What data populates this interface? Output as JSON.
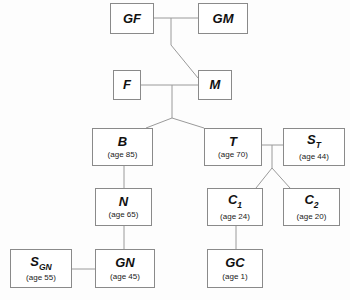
{
  "diagram": {
    "background_color": "#fdfdfd",
    "box_border_color": "#8a8a8a",
    "line_color": "#9a9a9a",
    "nodes": [
      {
        "id": "GF",
        "label": "GF",
        "subscript": "",
        "age": "",
        "x": 110,
        "y": 3,
        "w": 44,
        "h": 31
      },
      {
        "id": "GM",
        "label": "GM",
        "subscript": "",
        "age": "",
        "x": 198,
        "y": 3,
        "w": 50,
        "h": 31
      },
      {
        "id": "F",
        "label": "F",
        "subscript": "",
        "age": "",
        "x": 113,
        "y": 70,
        "w": 28,
        "h": 30
      },
      {
        "id": "M",
        "label": "M",
        "subscript": "",
        "age": "",
        "x": 198,
        "y": 70,
        "w": 34,
        "h": 30
      },
      {
        "id": "B",
        "label": "B",
        "subscript": "",
        "age": "(age 85)",
        "x": 92,
        "y": 128,
        "w": 61,
        "h": 38
      },
      {
        "id": "T",
        "label": "T",
        "subscript": "",
        "age": "(age 70)",
        "x": 204,
        "y": 128,
        "w": 58,
        "h": 38
      },
      {
        "id": "ST",
        "label": "S",
        "subscript": "T",
        "age": "(age 44)",
        "x": 283,
        "y": 128,
        "w": 62,
        "h": 38
      },
      {
        "id": "N",
        "label": "N",
        "subscript": "",
        "age": "(age 65)",
        "x": 95,
        "y": 188,
        "w": 57,
        "h": 38
      },
      {
        "id": "C1",
        "label": "C",
        "subscript": "1",
        "age": "(age 24)",
        "x": 207,
        "y": 188,
        "w": 56,
        "h": 38
      },
      {
        "id": "C2",
        "label": "C",
        "subscript": "2",
        "age": "(age 20)",
        "x": 283,
        "y": 188,
        "w": 57,
        "h": 38
      },
      {
        "id": "SGN",
        "label": "S",
        "subscript": "GN",
        "age": "(age 55)",
        "x": 10,
        "y": 249,
        "w": 62,
        "h": 39
      },
      {
        "id": "GN",
        "label": "GN",
        "subscript": "",
        "age": "(age 45)",
        "x": 95,
        "y": 249,
        "w": 60,
        "h": 39
      },
      {
        "id": "GC",
        "label": "GC",
        "subscript": "",
        "age": "(age 1)",
        "x": 207,
        "y": 249,
        "w": 56,
        "h": 39
      }
    ],
    "edges": [
      {
        "name": "gf-gm-marriage",
        "points": "154,18 198,18"
      },
      {
        "name": "grandparents-to-m",
        "points": "171,18 171,45 198,78"
      },
      {
        "name": "f-m-marriage",
        "points": "141,85 198,85"
      },
      {
        "name": "parents-drop",
        "points": "172,85 172,118"
      },
      {
        "name": "parents-to-b",
        "points": "172,118 146,128"
      },
      {
        "name": "parents-to-t",
        "points": "172,118 204,128"
      },
      {
        "name": "t-st-marriage",
        "points": "262,145 283,145"
      },
      {
        "name": "t-st-drop",
        "points": "272,145 272,168"
      },
      {
        "name": "t-st-to-c1",
        "points": "272,168 256,188"
      },
      {
        "name": "t-st-to-c2",
        "points": "272,168 290,188"
      },
      {
        "name": "b-to-n",
        "points": "124,166 124,188"
      },
      {
        "name": "n-to-gn",
        "points": "124,226 124,249"
      },
      {
        "name": "sgn-gn-marriage",
        "points": "72,269 95,269"
      },
      {
        "name": "c1-to-gc",
        "points": "236,226 236,249"
      }
    ]
  }
}
